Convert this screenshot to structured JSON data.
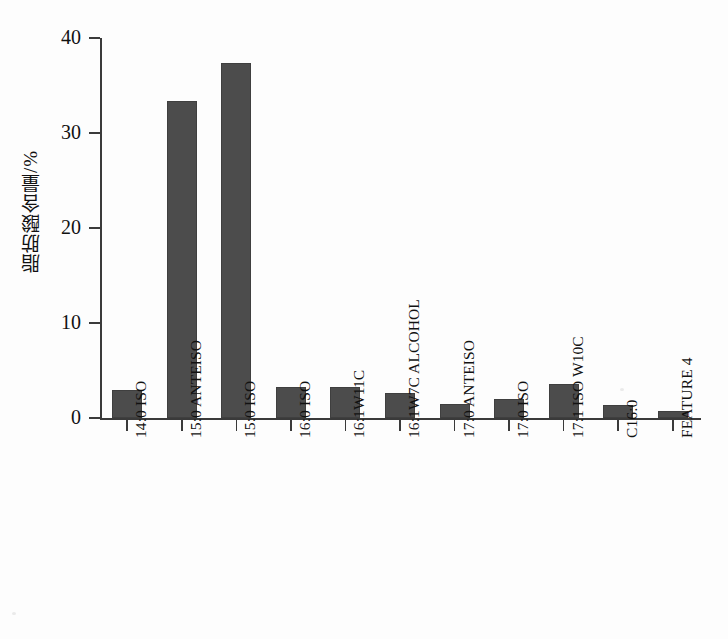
{
  "chart_data": {
    "type": "bar",
    "title": "",
    "xlabel": "",
    "ylabel": "脂肪酸含量/%",
    "ylim": [
      0,
      40
    ],
    "yticks": [
      0,
      10,
      20,
      30,
      40
    ],
    "grid": false,
    "legend": "none",
    "bar_color": "#4c4c4c",
    "categories": [
      "14:0 ISO",
      "15:0 ANTEISO",
      "15:0 ISO",
      "16:0 ISO",
      "16:1W11C",
      "16:1W7C ALCOHOL",
      "17:0 ANTEISO",
      "17:0 ISO",
      "17:1 ISO W10C",
      "C16:0",
      "FEATURE 4"
    ],
    "values": [
      3.0,
      33.4,
      37.4,
      3.3,
      3.3,
      2.6,
      1.5,
      2.0,
      3.6,
      1.4,
      0.7
    ]
  },
  "axis": {
    "y_title_text": "脂肪酸含量",
    "y_title_unit": "/%",
    "tick_labels_y": [
      "40",
      "30",
      "20",
      "10",
      "0"
    ]
  }
}
